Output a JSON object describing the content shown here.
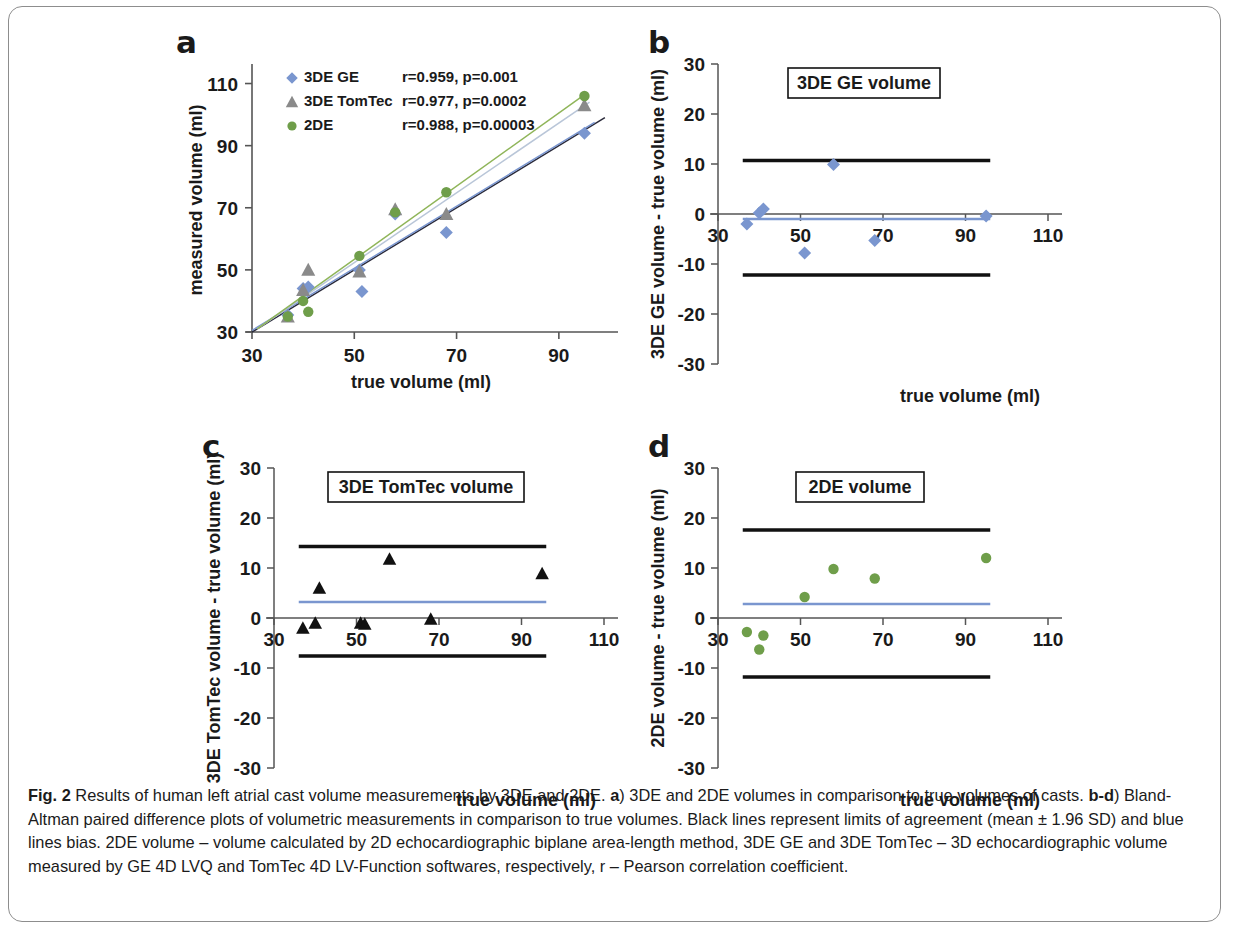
{
  "figure": {
    "label": "Fig. 2",
    "caption_segments": [
      {
        "bold": true,
        "text": "Fig. 2 "
      },
      {
        "bold": false,
        "text": "Results of human left atrial cast volume measurements by 3DE and 2DE. "
      },
      {
        "bold": true,
        "text": "a"
      },
      {
        "bold": false,
        "text": ") 3DE and 2DE volumes in comparison to true volumes of casts. "
      },
      {
        "bold": true,
        "text": "b-d"
      },
      {
        "bold": false,
        "text": ") Bland-Altman paired difference plots of volumetric measurements in comparison to true volumes. Black lines represent limits of agreement (mean ± 1.96 SD) and blue lines bias. 2DE volume – volume calculated by 2D echocardiographic biplane area-length method, 3DE GE and 3DE TomTec – 3D echocardiographic volume measured by GE 4D LVQ and TomTec 4D LV-Function softwares, respectively, r – Pearson correlation coefficient."
      }
    ]
  },
  "colors": {
    "blue": "#7a96cf",
    "blue_dark": "#4a64b0",
    "gray": "#8a8a8a",
    "green": "#6f9e4a",
    "green_light": "#8fb559",
    "black": "#111111",
    "axis": "#555555"
  },
  "panels": {
    "a": {
      "letter": "a",
      "xlabel": "true volume (ml)",
      "ylabel": "measured volume (ml)",
      "xticks": [
        "30",
        "50",
        "70",
        "90"
      ],
      "yticks": [
        "30",
        "50",
        "70",
        "90",
        "110"
      ],
      "legend": [
        {
          "marker": "diamond",
          "label": "3DE GE",
          "stat": "r=0.959, p=0.001",
          "color": "#7a96cf",
          "stat_color": "#8da6d8"
        },
        {
          "marker": "triangle",
          "label": "3DE TomTec",
          "stat": "r=0.977, p=0.0002",
          "color": "#8a8a8a",
          "stat_color": "#1a1a1a"
        },
        {
          "marker": "circle",
          "label": "2DE",
          "stat": "r=0.988, p=0.00003",
          "color": "#6f9e4a",
          "stat_color": "#8fb559"
        }
      ]
    },
    "b": {
      "letter": "b",
      "title": "3DE GE volume",
      "xlabel": "true volume (ml)",
      "ylabel": "3DE GE volume - true volume (ml)",
      "xticks": [
        "30",
        "50",
        "70",
        "90",
        "110"
      ],
      "yticks": [
        "30",
        "20",
        "10",
        "0",
        "-10",
        "-20",
        "-30"
      ]
    },
    "c": {
      "letter": "c",
      "title": "3DE TomTec volume",
      "xlabel": "true volume (ml)",
      "ylabel": "3DE TomTec volume - true volume (ml)",
      "xticks": [
        "30",
        "50",
        "70",
        "90",
        "110"
      ],
      "yticks": [
        "30",
        "20",
        "10",
        "0",
        "-10",
        "-20",
        "-30"
      ]
    },
    "d": {
      "letter": "d",
      "title": "2DE volume",
      "xlabel": "true volume (ml)",
      "ylabel": "2DE volume - true volume (ml)",
      "xticks": [
        "30",
        "50",
        "70",
        "90",
        "110"
      ],
      "yticks": [
        "30",
        "20",
        "10",
        "0",
        "-10",
        "-20",
        "-30"
      ]
    }
  },
  "chart_data": [
    {
      "type": "scatter",
      "panel": "a",
      "title": "3DE and 2DE volumes in comparison to true volumes of casts",
      "xlabel": "true volume (ml)",
      "ylabel": "measured volume (ml)",
      "xlim": [
        30,
        100
      ],
      "ylim": [
        30,
        115
      ],
      "xticks": [
        30,
        50,
        70,
        90
      ],
      "yticks": [
        30,
        50,
        70,
        90,
        110
      ],
      "grid": false,
      "legend_position": "top-left",
      "identity_line": true,
      "series": [
        {
          "name": "3DE GE",
          "marker": "diamond",
          "color": "#7a96cf",
          "r": 0.959,
          "p": 0.001,
          "annotation": "r=0.959, p=0.001",
          "x": [
            37,
            40,
            41,
            51,
            51.5,
            58,
            68,
            95
          ],
          "y": [
            35.5,
            44,
            44.5,
            50,
            43,
            68,
            62,
            94
          ]
        },
        {
          "name": "3DE TomTec",
          "marker": "triangle",
          "color": "#8a8a8a",
          "r": 0.977,
          "p": 0.0002,
          "annotation": "r=0.977, p=0.0002",
          "x": [
            37,
            40,
            41,
            51,
            58,
            68,
            95
          ],
          "y": [
            35,
            43.5,
            50,
            49.5,
            69.5,
            68,
            103
          ]
        },
        {
          "name": "2DE",
          "marker": "circle",
          "color": "#6f9e4a",
          "r": 0.988,
          "p": 3e-05,
          "annotation": "r=0.988, p=0.00003",
          "x": [
            37,
            40,
            41,
            51,
            58,
            68,
            95
          ],
          "y": [
            35,
            40,
            36.5,
            54.5,
            68.5,
            75,
            106
          ]
        }
      ]
    },
    {
      "type": "scatter",
      "panel": "b",
      "title": "3DE GE volume",
      "subtitle": "Bland-Altman paired difference plot",
      "xlabel": "true volume (ml)",
      "ylabel": "3DE GE volume - true volume (ml)",
      "xlim": [
        30,
        110
      ],
      "ylim": [
        -30,
        30
      ],
      "xticks": [
        30,
        50,
        70,
        90,
        110
      ],
      "yticks": [
        -30,
        -20,
        -10,
        0,
        10,
        20,
        30
      ],
      "grid": false,
      "marker": "diamond",
      "color": "#7a96cf",
      "x": [
        37,
        40,
        41,
        51,
        58,
        68,
        95
      ],
      "y": [
        -2.0,
        0.2,
        1.0,
        -7.8,
        9.9,
        -5.3,
        -0.4
      ],
      "bias": -1.0,
      "upper_loa": 10.7,
      "lower_loa": -12.2,
      "loa_color": "#111111",
      "bias_color": "#7a96cf"
    },
    {
      "type": "scatter",
      "panel": "c",
      "title": "3DE TomTec volume",
      "subtitle": "Bland-Altman paired difference plot",
      "xlabel": "true volume (ml)",
      "ylabel": "3DE TomTec volume - true volume (ml)",
      "xlim": [
        30,
        110
      ],
      "ylim": [
        -30,
        30
      ],
      "xticks": [
        30,
        50,
        70,
        90,
        110
      ],
      "yticks": [
        -30,
        -20,
        -10,
        0,
        10,
        20,
        30
      ],
      "grid": false,
      "marker": "triangle",
      "color": "#111111",
      "x": [
        37,
        40,
        41,
        51,
        52,
        58,
        68,
        95
      ],
      "y": [
        -2.0,
        -1.0,
        6.0,
        -1.0,
        -1.2,
        11.8,
        -0.2,
        8.9
      ],
      "bias": 3.2,
      "upper_loa": 14.3,
      "lower_loa": -7.6,
      "loa_color": "#111111",
      "bias_color": "#7a96cf"
    },
    {
      "type": "scatter",
      "panel": "d",
      "title": "2DE volume",
      "subtitle": "Bland-Altman paired difference plot",
      "xlabel": "true volume (ml)",
      "ylabel": "2DE volume - true volume (ml)",
      "xlim": [
        30,
        110
      ],
      "ylim": [
        -30,
        30
      ],
      "xticks": [
        30,
        50,
        70,
        90,
        110
      ],
      "yticks": [
        -30,
        -20,
        -10,
        0,
        10,
        20,
        30
      ],
      "grid": false,
      "marker": "circle",
      "color": "#6f9e4a",
      "x": [
        37,
        40,
        41,
        51,
        58,
        68,
        95
      ],
      "y": [
        -2.8,
        -6.3,
        -3.5,
        4.2,
        9.8,
        7.9,
        12.0
      ],
      "bias": 2.8,
      "upper_loa": 17.6,
      "lower_loa": -11.8,
      "loa_color": "#111111",
      "bias_color": "#7a96cf"
    }
  ]
}
